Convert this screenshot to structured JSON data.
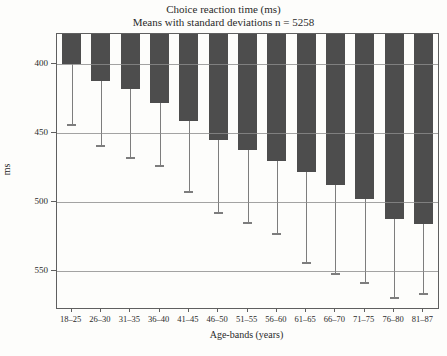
{
  "chart_data": {
    "type": "bar",
    "title": "Choice reaction time (ms)",
    "subtitle": "Means with standard deviations n = 5258",
    "xlabel": "Age-bands (years)",
    "ylabel": "ms",
    "categories": [
      "18–25",
      "26–30",
      "31–35",
      "36–40",
      "41–45",
      "46–50",
      "51–55",
      "56–60",
      "61–65",
      "66–70",
      "71–75",
      "76–80",
      "81–87"
    ],
    "series": [
      {
        "name": "Mean choice reaction time (ms)",
        "values": [
          400,
          412,
          418,
          428,
          441,
          455,
          462,
          470,
          478,
          488,
          498,
          512,
          516
        ]
      },
      {
        "name": "Mean plus 1 standard deviation (error-bar end)",
        "values": [
          444,
          459,
          468,
          474,
          493,
          508,
          515,
          523,
          544,
          552,
          559,
          570,
          567
        ]
      }
    ],
    "y_axis": {
      "ticks": [
        400,
        450,
        500,
        550
      ],
      "top_value": 378,
      "bottom_value": 577,
      "inverted": true,
      "note": "bars hang downward from the top of the plot; error bars extend below bar ends"
    },
    "grid": true,
    "legend": "none",
    "bar_color": "#4d4d4d",
    "error_bar_color": "#7d7d7d"
  }
}
